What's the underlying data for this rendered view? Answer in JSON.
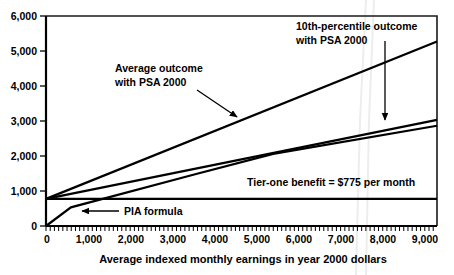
{
  "chart_data": {
    "type": "line",
    "title": "",
    "xlabel": "Average indexed monthly earnings in year 2000 dollars",
    "ylabel": "",
    "xlim": [
      0,
      9290
    ],
    "ylim": [
      0,
      6000
    ],
    "grid": false,
    "legend_position": "none",
    "x_ticks": [
      "0",
      "1,000",
      "2,000",
      "3,000",
      "4,000",
      "5,000",
      "6,000",
      "7,000",
      "8,000",
      "9,000"
    ],
    "x_tick_values": [
      0,
      1000,
      2000,
      3000,
      4000,
      5000,
      6000,
      7000,
      8000,
      9000
    ],
    "x_minor_tick_step": 100,
    "y_ticks": [
      "0",
      "1,000",
      "2,000",
      "3,000",
      "4,000",
      "5,000",
      "6,000"
    ],
    "y_tick_values": [
      0,
      1000,
      2000,
      3000,
      4000,
      5000,
      6000
    ],
    "series": [
      {
        "name": "Average outcome with PSA 2000",
        "points": [
          [
            0,
            775
          ],
          [
            9290,
            5270
          ]
        ]
      },
      {
        "name": "10th-percentile outcome with PSA 2000",
        "points": [
          [
            0,
            775
          ],
          [
            9290,
            3030
          ]
        ]
      },
      {
        "name": "PIA formula",
        "points": [
          [
            0,
            0
          ],
          [
            592,
            533
          ],
          [
            3567,
            1485
          ],
          [
            5397,
            2062
          ],
          [
            9290,
            2865
          ]
        ]
      },
      {
        "name": "Tier-one benefit",
        "points": [
          [
            0,
            775
          ],
          [
            9290,
            775
          ]
        ]
      }
    ],
    "annotations": [
      {
        "id": "tenth-percentile",
        "lines": [
          "10th-percentile outcome",
          "with  PSA 2000"
        ],
        "text_x": 296,
        "text_y": 26,
        "arrow_from": [
          385,
          41
        ],
        "arrow_to": [
          385,
          124
        ]
      },
      {
        "id": "average-outcome",
        "lines": [
          "Average outcome",
          "with PSA 2000"
        ],
        "text_x": 115,
        "text_y": 68,
        "arrow_from": [
          197,
          90
        ],
        "arrow_to": [
          240,
          119
        ]
      },
      {
        "id": "tier-one-benefit",
        "lines": [
          "Tier-one benefit = $775 per month"
        ],
        "text_x": 247,
        "text_y": 182,
        "arrow_from": null,
        "arrow_to": null
      },
      {
        "id": "pia-formula",
        "lines": [
          "PIA formula"
        ],
        "text_x": 123,
        "text_y": 214,
        "arrow_from": [
          119,
          211
        ],
        "arrow_to": [
          78,
          211
        ]
      }
    ]
  },
  "axis": {
    "x_title": "Average indexed monthly earnings in year 2000 dollars"
  },
  "labels": {
    "y": [
      "6,000",
      "5,000",
      "4,000",
      "3,000",
      "2,000",
      "1,000",
      "0"
    ],
    "x": [
      "0",
      "1,000",
      "2,000",
      "3,000",
      "4,000",
      "5,000",
      "6,000",
      "7,000",
      "8,000",
      "9,000"
    ]
  },
  "annotations": {
    "tenth_percentile_line1": "10th-percentile outcome",
    "tenth_percentile_line2": "with  PSA 2000",
    "average_outcome_line1": "Average outcome",
    "average_outcome_line2": "with PSA 2000",
    "tier_one": "Tier-one benefit = $775 per month",
    "pia_formula": "PIA formula"
  },
  "colors": {
    "line": "#000000",
    "frame": "#1a1a1a",
    "background": "#ffffff",
    "watermark": "#ededed"
  }
}
